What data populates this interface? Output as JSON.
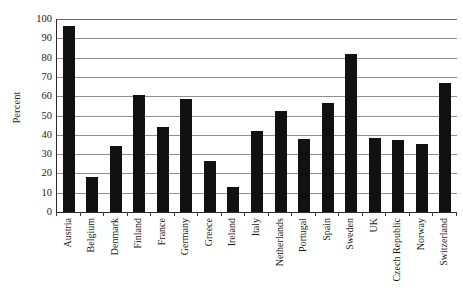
{
  "chart_data": {
    "type": "bar",
    "title": "",
    "subtitle": "",
    "xlabel": "",
    "ylabel": "Percent",
    "ylim": [
      0,
      100
    ],
    "ytick_step": 10,
    "yticks": [
      0,
      10,
      20,
      30,
      40,
      50,
      60,
      70,
      80,
      90,
      100
    ],
    "ytick_labels": [
      "0",
      "10",
      "20",
      "30",
      "40",
      "50",
      "60",
      "70",
      "80",
      "90",
      "100"
    ],
    "grid": "horizontal",
    "legend": "none",
    "bar_color": "#111111",
    "gridline_color": "#8f8f8f",
    "axis_color": "#2b2b2b",
    "xtick_label_rotation": -90,
    "categories": [
      "Austria",
      "Belgium",
      "Denmark",
      "Finland",
      "France",
      "Germany",
      "Greece",
      "Ireland",
      "Italy",
      "Netherlands",
      "Portugal",
      "Spain",
      "Sweden",
      "UK",
      "Czech Republic",
      "Norway",
      "Switzerland"
    ],
    "values": [
      96.5,
      18,
      34,
      60.5,
      44,
      58.5,
      26.5,
      13,
      42,
      52.5,
      38,
      56.5,
      82,
      38.5,
      37.5,
      35.5,
      67
    ],
    "annotations": []
  }
}
